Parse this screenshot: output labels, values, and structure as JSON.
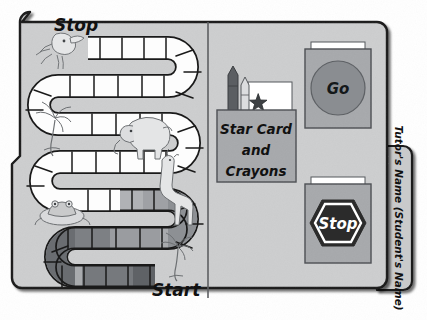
{
  "document": {
    "type": "file-folder-game-board",
    "title": "Jungle Path File Folder Game"
  },
  "colors": {
    "page_background": "#ffffff",
    "folder_fill": "#c9cacb",
    "folder_fill_light": "#d2d3d4",
    "folder_outline": "#1a1a1a",
    "divider": "#5d5f62",
    "pocket_fill": "#a7a9ac",
    "pocket_outline": "#55585c",
    "card_white": "#ffffff",
    "go_circle": "#8a8d91",
    "stop_hex_dark": "#2b2b2b",
    "stop_hex_outline": "#ffffff",
    "path_white": "#fdfdfd",
    "path_light_gray": "#b9bbbd",
    "path_mid_gray": "#9a9ca0",
    "path_dark_gray": "#76797d",
    "path_outline": "#1a1a1a",
    "crayon_dark": "#5b5e62",
    "crayon_light": "#c5c7c9",
    "animal_line": "#6d7073"
  },
  "board": {
    "start_label": "Start",
    "stop_label": "Stop",
    "path": {
      "total_squares": 62,
      "shaded_from_square": 40,
      "description": "S-shaped snaking track of squares from Start (bottom right) to Stop (top left)"
    },
    "animals": [
      {
        "name": "parrot-illustration",
        "label": "Parrot"
      },
      {
        "name": "palm-tree-illustration",
        "label": "Palm tree"
      },
      {
        "name": "elephant-illustration",
        "label": "Elephant"
      },
      {
        "name": "giraffe-illustration",
        "label": "Giraffe"
      },
      {
        "name": "frog-illustration",
        "label": "Frog"
      },
      {
        "name": "palm-tree-illustration-2",
        "label": "Palm tree"
      }
    ]
  },
  "pocket": {
    "line1": "Star Card",
    "line2": "and",
    "line3": "Crayons",
    "contents": [
      "crayon-dark",
      "crayon-light",
      "star-card"
    ]
  },
  "go_card": {
    "label": "Go"
  },
  "stop_card": {
    "label": "Stop"
  },
  "tab": {
    "label": "Tutor's Name (Student's Name)"
  }
}
